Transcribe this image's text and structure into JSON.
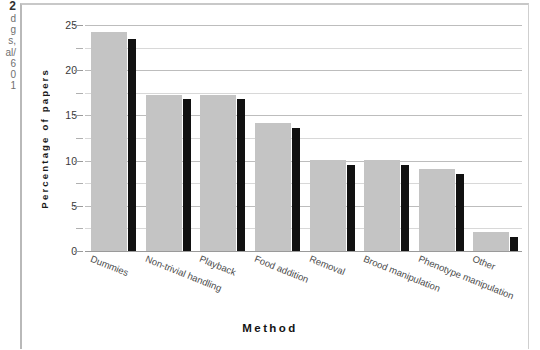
{
  "page_margin": {
    "fragments": [
      "2",
      "d",
      "g",
      "s,",
      "al/",
      "6",
      "0",
      "1"
    ]
  },
  "chart_data": {
    "type": "bar",
    "title": "",
    "xlabel": "Method",
    "ylabel": "Percentage of papers",
    "categories": [
      "Dummies",
      "Non-trivial handling",
      "Playback",
      "Food addition",
      "Removal",
      "Brood manipulation",
      "Phenotype manipulation",
      "Other"
    ],
    "series": [
      {
        "name": "gray",
        "color": "#c4c4c4",
        "values": [
          24.2,
          17.3,
          17.3,
          14.2,
          10.1,
          10.1,
          9.1,
          2.1
        ]
      },
      {
        "name": "black",
        "color": "#111111",
        "values": [
          23.4,
          16.8,
          16.8,
          13.6,
          9.5,
          9.5,
          8.5,
          1.5
        ]
      }
    ],
    "ylim": [
      0,
      25
    ],
    "yticks": [
      0,
      5,
      10,
      15,
      20,
      25
    ],
    "yticks_minor": [
      2.5,
      7.5,
      12.5,
      17.5,
      22.5
    ],
    "ytick_labels": [
      "0",
      "5",
      "10",
      "15",
      "20",
      "25"
    ],
    "grid": true,
    "legend": "none"
  }
}
